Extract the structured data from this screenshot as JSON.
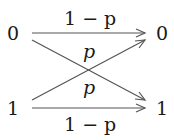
{
  "diagram": {
    "type": "binary-symmetric-channel",
    "inputs": [
      {
        "label": "0"
      },
      {
        "label": "1"
      }
    ],
    "outputs": [
      {
        "label": "0"
      },
      {
        "label": "1"
      }
    ],
    "edges": [
      {
        "from": "0",
        "to": "0",
        "label": "1 − p"
      },
      {
        "from": "0",
        "to": "1",
        "label": "p"
      },
      {
        "from": "1",
        "to": "0",
        "label": "p"
      },
      {
        "from": "1",
        "to": "1",
        "label": "1 − p"
      }
    ],
    "line_color": "#555555",
    "text_color": "#1a1a1a"
  }
}
